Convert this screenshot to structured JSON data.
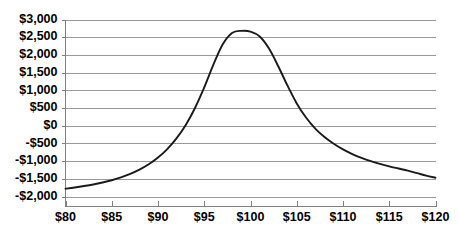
{
  "chart_data": {
    "type": "line",
    "title": "",
    "subtitle": "",
    "xlabel": "",
    "ylabel": "",
    "xlim": [
      80,
      120
    ],
    "ylim": [
      -2000,
      3000
    ],
    "grid": true,
    "legend": false,
    "legend_position": "none",
    "x_tick_labels": [
      "$80",
      "$85",
      "$90",
      "$95",
      "$100",
      "$105",
      "$110",
      "$115",
      "$120"
    ],
    "x_ticks": [
      80,
      85,
      90,
      95,
      100,
      105,
      110,
      115,
      120
    ],
    "y_tick_labels": [
      "$3,000",
      "$2,500",
      "$2,000",
      "$1,500",
      "$1,000",
      "$500",
      "$0",
      "-$500",
      "-$1,000",
      "-$1,500",
      "-$2,000"
    ],
    "y_ticks": [
      3000,
      2500,
      2000,
      1500,
      1000,
      500,
      0,
      -500,
      -1000,
      -1500,
      -2000
    ],
    "series": [
      {
        "name": "Profit",
        "color": "#1a1a1a",
        "x": [
          80,
          81,
          82,
          83,
          84,
          85,
          86,
          87,
          88,
          89,
          90,
          91,
          92,
          93,
          94,
          95,
          96,
          97,
          98,
          99,
          100,
          101,
          102,
          103,
          104,
          105,
          106,
          107,
          108,
          109,
          110,
          111,
          112,
          113,
          114,
          115,
          116,
          117,
          118,
          119,
          120
        ],
        "values": [
          -1780,
          -1745,
          -1705,
          -1660,
          -1605,
          -1540,
          -1460,
          -1360,
          -1240,
          -1090,
          -900,
          -660,
          -360,
          20,
          500,
          1080,
          1730,
          2300,
          2620,
          2680,
          2660,
          2520,
          2180,
          1680,
          1130,
          630,
          230,
          -80,
          -320,
          -510,
          -670,
          -800,
          -910,
          -1000,
          -1080,
          -1150,
          -1210,
          -1270,
          -1340,
          -1410,
          -1470
        ]
      }
    ],
    "annotations": {
      "peak_x": 100,
      "peak_y": 2680,
      "start_value": -1780,
      "end_value": -1470,
      "zero_crossings": [
        96.5,
        107.5
      ]
    },
    "colors": {
      "gridline": "#9a9a9a",
      "axis": "#7f7f7f",
      "series": "#1a1a1a",
      "background": "#ffffff",
      "text": "#000000"
    }
  }
}
